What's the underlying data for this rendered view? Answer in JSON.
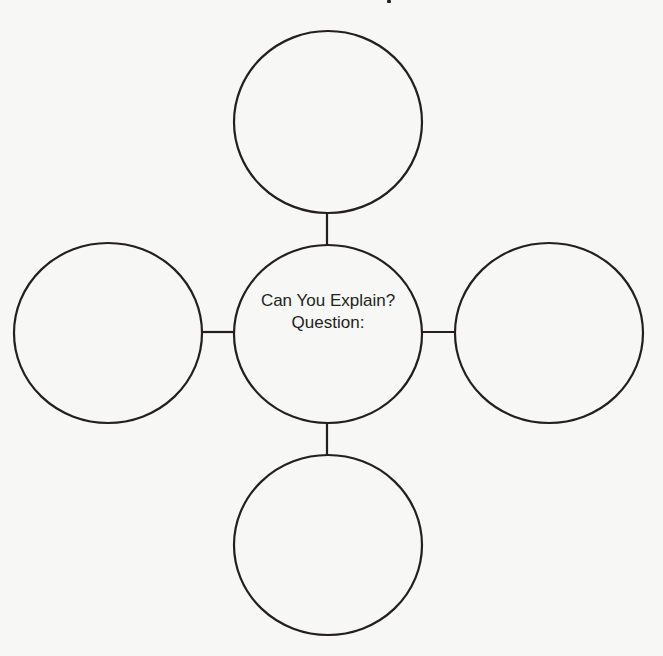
{
  "diagram": {
    "type": "bubble-map",
    "stroke_color": "#231f20",
    "background_color": "#f7f7f6",
    "center": {
      "line1": "Can You Explain?",
      "line2": "Question:"
    },
    "nodes": [
      {
        "id": "top",
        "label": ""
      },
      {
        "id": "left",
        "label": ""
      },
      {
        "id": "right",
        "label": ""
      },
      {
        "id": "bottom",
        "label": ""
      }
    ]
  }
}
